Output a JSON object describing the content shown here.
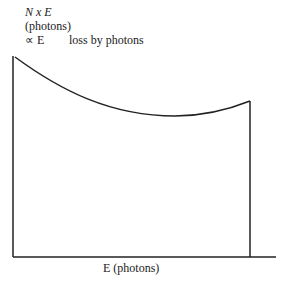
{
  "diagram": {
    "y_axis_label": {
      "line1": "N x E",
      "line2": "(photons)",
      "line3_symbol": "∝ E",
      "annotation": "loss by photons"
    },
    "x_axis_label": "E (photons)",
    "line_color": "#222222",
    "curve": {
      "description": "Decreasing then rising curve; left start high, minimum near right-center, ends with vertical cutoff",
      "start": [
        14,
        56
      ],
      "minimum": [
        175,
        116
      ],
      "end": [
        250,
        101
      ],
      "cutoff_x": 250
    }
  }
}
